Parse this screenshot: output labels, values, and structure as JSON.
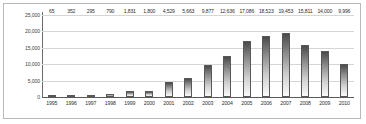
{
  "chart_data": {
    "type": "bar",
    "title": "",
    "xlabel": "",
    "ylabel": "",
    "grid": true,
    "legend": "none",
    "ylim": [
      0,
      25000
    ],
    "ytick_labels": [
      "25,000",
      "20,000",
      "15,000",
      "10,000",
      "5,000",
      "0"
    ],
    "ytick_values": [
      25000,
      20000,
      15000,
      10000,
      5000,
      0
    ],
    "categories": [
      "1995",
      "1996",
      "1997",
      "1998",
      "1999",
      "2000",
      "2001",
      "2002",
      "2003",
      "2004",
      "2005",
      "2006",
      "2007",
      "2008",
      "2009",
      "2010"
    ],
    "values": [
      65,
      352,
      295,
      790,
      1831,
      1800,
      4529,
      5663,
      9877,
      12636,
      17086,
      18523,
      19453,
      15811,
      14000,
      9996
    ],
    "value_labels": [
      "65",
      "352",
      "295",
      "790",
      "1,831",
      "1,800",
      "4,529",
      "5,663",
      "9,877",
      "12,636",
      "17,086",
      "18,523",
      "19,453",
      "15,811",
      "14,000",
      "9,996"
    ],
    "colors": {
      "bar_top": "#4a4a4a",
      "bar_bottom": "#fbfbfb",
      "bar_outline": "#585858",
      "gridline": "#d6d6d6",
      "axis": "#5a5a5a",
      "label_text": "#2e2e2e",
      "frame_border": "#b9b9b9",
      "background": "#ffffff"
    }
  }
}
